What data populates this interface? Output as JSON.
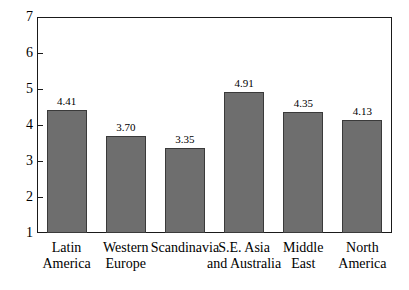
{
  "chart_data": {
    "type": "bar",
    "title": "",
    "subtitle": "",
    "xlabel": "",
    "ylabel": "",
    "ylim": [
      1,
      7
    ],
    "yticks": [
      "1",
      "2",
      "3",
      "4",
      "5",
      "6",
      "7"
    ],
    "grid": false,
    "legend": false,
    "categories": [
      "Latin America",
      "Western Europe",
      "Scandinavia",
      "S.E. Asia and Australia",
      "Middle East",
      "North America"
    ],
    "category_lines": [
      [
        "Latin",
        "America"
      ],
      [
        "Western",
        "Europe"
      ],
      [
        "Scandinavia",
        ""
      ],
      [
        "S.E. Asia",
        "and Australia"
      ],
      [
        "Middle",
        "East"
      ],
      [
        "North",
        "America"
      ]
    ],
    "values": [
      4.41,
      3.7,
      3.35,
      4.91,
      4.35,
      4.13
    ],
    "value_labels": [
      "4.41",
      "3.70",
      "3.35",
      "4.91",
      "4.35",
      "4.13"
    ],
    "bar_color": "#6e6e6e",
    "bar_edge_color": "#3a3a3a",
    "axis_color": "#1a1a1a",
    "background_color": "#ffffff"
  }
}
